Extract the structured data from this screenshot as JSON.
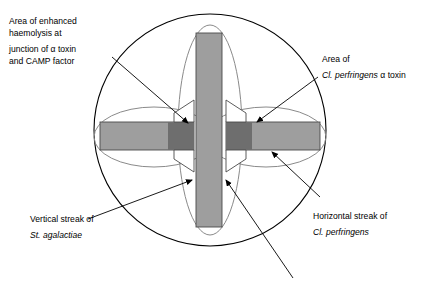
{
  "figure": {
    "plate": {
      "name": "blood agar plate outline",
      "shape": "circle"
    },
    "colors": {
      "outline": "#000000",
      "halo_outline": "#7a7a7a",
      "streak_fill": "#9e9e9e",
      "streak_dark_fill": "#6e6e6e",
      "background": "#ffffff",
      "text": "#000000"
    },
    "labels": [
      {
        "name": "label-enhanced-haemolysis",
        "lines": [
          {
            "text": "Area of enhanced",
            "italic": false
          },
          {
            "text": "haemolysis at",
            "italic": false
          },
          {
            "text": "junction of α toxin",
            "italic": false
          },
          {
            "text": "and CAMP factor",
            "italic": false
          }
        ]
      },
      {
        "name": "label-alpha-toxin-area",
        "lines": [
          {
            "text": "Area of",
            "italic": false
          },
          {
            "text": "Cl. perfringens",
            "italic": true,
            "suffix": " α toxin"
          }
        ]
      },
      {
        "name": "label-vertical-streak",
        "lines": [
          {
            "text": "Vertical streak of",
            "italic": false
          },
          {
            "text": "St. agalactiae",
            "italic": true
          }
        ]
      },
      {
        "name": "label-horizontal-streak",
        "lines": [
          {
            "text": "Horizontal streak of",
            "italic": false
          },
          {
            "text": "Cl. perfringens",
            "italic": true
          }
        ]
      }
    ],
    "text": {
      "enhanced_l1": "Area of enhanced",
      "enhanced_l2": "haemolysis at",
      "enhanced_l3": "junction of α toxin",
      "enhanced_l4": "and CAMP factor",
      "alpha_l1": "Area of",
      "alpha_l2_italic": "Cl. perfringens",
      "alpha_l2_tail": " α toxin",
      "vertical_l1": "Vertical streak of",
      "vertical_l2_italic": "St. agalactiae",
      "horizontal_l1": "Horizontal streak of",
      "horizontal_l2_italic": "Cl. perfringens"
    },
    "elements": {
      "vertical_streak": "Vertical streak of St. agalactiae",
      "horizontal_streak_left": "Horizontal streak of Cl. perfringens (left)",
      "horizontal_streak_right": "Horizontal streak of Cl. perfringens (right)",
      "vertical_halo": "Haemolysis halo around vertical streak",
      "horizontal_halo_left": "Alpha toxin haemolysis halo (left)",
      "horizontal_halo_right": "Alpha toxin haemolysis halo (right)",
      "junction_upper_left": "Arrowhead zone of enhanced haemolysis (upper left)",
      "junction_upper_right": "Arrowhead zone of enhanced haemolysis (upper right)",
      "junction_lower_left": "Arrowhead zone of enhanced haemolysis (lower left)",
      "junction_lower_right": "Arrowhead zone of enhanced haemolysis (lower right)"
    }
  }
}
